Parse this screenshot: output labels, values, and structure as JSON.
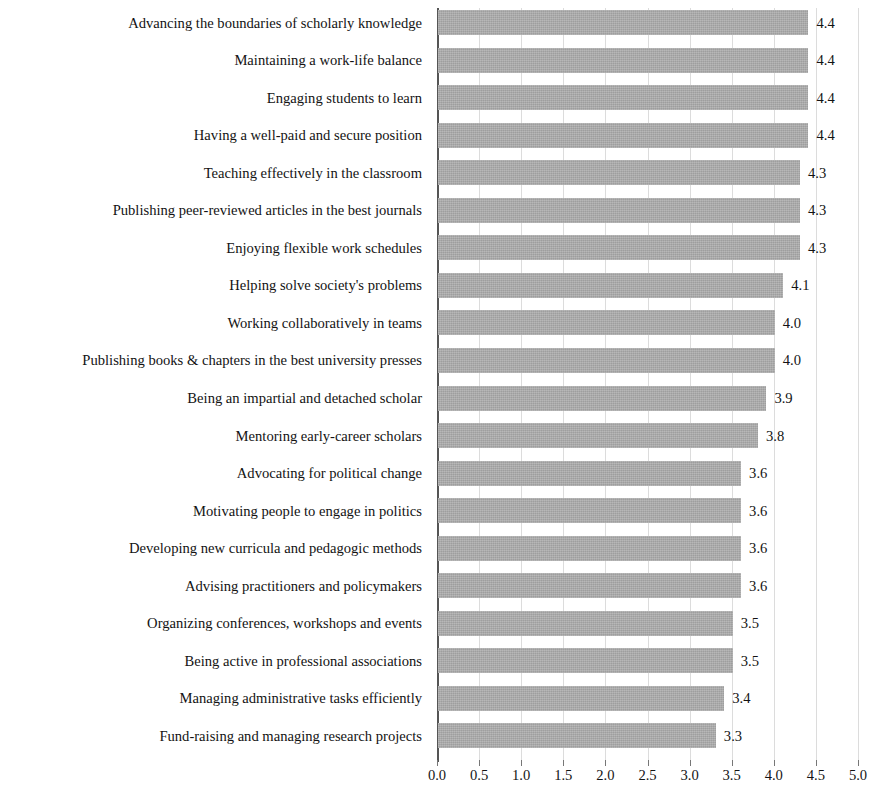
{
  "chart_data": {
    "type": "bar",
    "orientation": "horizontal",
    "title": "",
    "subtitle": "",
    "xlabel": "",
    "ylabel": "",
    "xlim": [
      0.0,
      5.0
    ],
    "xticks": [
      "0.0",
      "0.5",
      "1.0",
      "1.5",
      "2.0",
      "2.5",
      "3.0",
      "3.5",
      "4.0",
      "4.5",
      "5.0"
    ],
    "xtick_values": [
      0.0,
      0.5,
      1.0,
      1.5,
      2.0,
      2.5,
      3.0,
      3.5,
      4.0,
      4.5,
      5.0
    ],
    "grid": "vertical-only",
    "legend": "none",
    "bar_color": "#a9a9a9",
    "categories": [
      "Advancing the boundaries of scholarly knowledge",
      "Maintaining a work-life balance",
      "Engaging students to learn",
      "Having a well-paid and secure position",
      "Teaching effectively in the classroom",
      "Publishing peer-reviewed articles in the best journals",
      "Enjoying flexible work schedules",
      "Helping solve society's problems",
      "Working collaboratively in teams",
      "Publishing books & chapters in the best university presses",
      "Being an impartial and detached scholar",
      "Mentoring early-career scholars",
      "Advocating for political change",
      "Motivating people to engage in politics",
      "Developing new curricula and pedagogic methods",
      "Advising practitioners and policymakers",
      "Organizing conferences, workshops and events",
      "Being active in professional associations",
      "Managing administrative tasks efficiently",
      "Fund-raising and managing research projects"
    ],
    "values": [
      4.4,
      4.4,
      4.4,
      4.4,
      4.3,
      4.3,
      4.3,
      4.1,
      4.0,
      4.0,
      3.9,
      3.8,
      3.6,
      3.6,
      3.6,
      3.6,
      3.5,
      3.5,
      3.4,
      3.3
    ],
    "value_labels": [
      "4.4",
      "4.4",
      "4.4",
      "4.4",
      "4.3",
      "4.3",
      "4.3",
      "4.1",
      "4.0",
      "4.0",
      "3.9",
      "3.8",
      "3.6",
      "3.6",
      "3.6",
      "3.6",
      "3.5",
      "3.5",
      "3.4",
      "3.3"
    ]
  }
}
